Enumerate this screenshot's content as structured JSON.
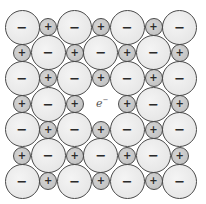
{
  "diagram": {
    "title": "",
    "colors": {
      "anion_fill": "#ebebeb",
      "cation_fill": "#c8c8c8",
      "stroke": "#4a4a4a",
      "sign": "#2a2a2a"
    },
    "labels": {
      "anion_sign": "−",
      "cation_sign": "+",
      "electron": "e",
      "electron_sup": "−"
    },
    "grid": {
      "rows": 7,
      "cols": 7,
      "origin_x": 22,
      "origin_y": 27,
      "dx": 26.3,
      "dy": 25.7
    },
    "rows": [
      [
        "-",
        "+",
        "-",
        "+",
        "-",
        "+",
        "-"
      ],
      [
        "+",
        "-",
        "+",
        "-",
        "+",
        "-",
        "+"
      ],
      [
        "-",
        "+",
        "-",
        "+",
        "-",
        "+",
        "-"
      ],
      [
        "+",
        "-",
        "+",
        "e",
        "+",
        "-",
        "+"
      ],
      [
        "-",
        "+",
        "-",
        "+",
        "-",
        "+",
        "-"
      ],
      [
        "+",
        "-",
        "+",
        "-",
        "+",
        "-",
        "+"
      ],
      [
        "-",
        "+",
        "-",
        "+",
        "-",
        "+",
        "-"
      ]
    ],
    "vacancy": {
      "row": 3,
      "col": 3,
      "occupant": "e−"
    }
  }
}
